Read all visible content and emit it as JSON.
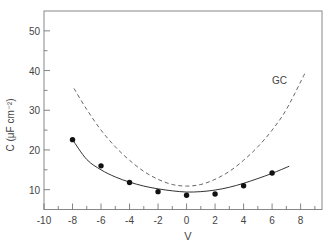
{
  "chart_data": {
    "type": "scatter",
    "title": "",
    "xlabel": "V",
    "ylabel": "C (μF cm⁻²)",
    "xlim": [
      -10,
      9.5
    ],
    "ylim": [
      5,
      55
    ],
    "x_ticks": [
      -10,
      -8,
      -6,
      -4,
      -2,
      0,
      2,
      4,
      6,
      8
    ],
    "x_minor_step": 1,
    "y_ticks": [
      10,
      20,
      30,
      40,
      50
    ],
    "y_minor_step": 5,
    "grid": false,
    "annotations": [
      {
        "text": "GC",
        "x": 6.0,
        "y": 36.5
      }
    ],
    "series": [
      {
        "name": "measured",
        "style": "markers",
        "x": [
          -8,
          -6,
          -4,
          -2,
          0,
          2,
          4,
          6
        ],
        "y": [
          22.6,
          16.0,
          11.8,
          9.5,
          8.6,
          8.9,
          11.0,
          14.2
        ]
      },
      {
        "name": "fit",
        "style": "solid-line",
        "x": [
          -8,
          -7,
          -6,
          -5,
          -4,
          -3,
          -2,
          -1,
          0,
          1,
          2,
          3,
          4,
          5,
          6,
          7.2
        ],
        "y": [
          22.6,
          17.6,
          15.0,
          13.2,
          11.9,
          10.9,
          10.2,
          9.7,
          9.4,
          9.5,
          9.9,
          10.6,
          11.6,
          12.8,
          14.1,
          15.9
        ]
      },
      {
        "name": "GC",
        "style": "dashed-line",
        "x": [
          -7.9,
          -7,
          -6,
          -5,
          -4,
          -3,
          -2,
          -1,
          0,
          1,
          2,
          3,
          4,
          5,
          6,
          7,
          8.3
        ],
        "y": [
          35.5,
          30.2,
          25.0,
          20.8,
          17.4,
          14.6,
          12.6,
          11.3,
          10.9,
          11.3,
          12.6,
          14.6,
          17.4,
          20.8,
          25.0,
          30.2,
          39.3
        ]
      }
    ]
  }
}
